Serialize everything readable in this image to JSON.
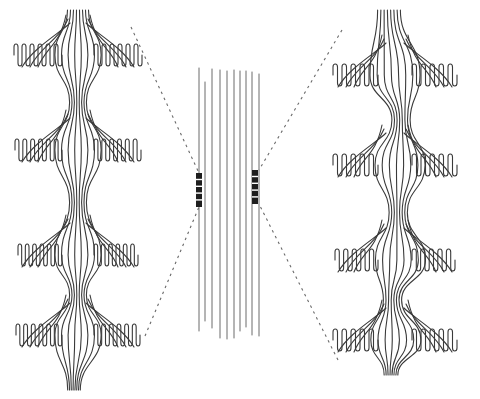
{
  "figure": {
    "colors": {
      "background": "#ffffff",
      "line": "#3a3a3a",
      "band": "#1e1e1e",
      "dash": "#6a6a6a"
    },
    "left_bundle": {
      "center_x": 78,
      "top_y": 10,
      "bottom_y": 390,
      "core_half_width": 12,
      "loop_rows": [
        {
          "y": 55,
          "half_span": 64,
          "loops_per_side": 6
        },
        {
          "y": 150,
          "half_span": 63,
          "loops_per_side": 6
        },
        {
          "y": 255,
          "half_span": 60,
          "loops_per_side": 6
        },
        {
          "y": 335,
          "half_span": 62,
          "loops_per_side": 6
        }
      ]
    },
    "right_bundle": {
      "center_x": 395,
      "top_y": 10,
      "bottom_y": 375,
      "skew": 6,
      "loop_rows": [
        {
          "y": 75,
          "half_span": 62,
          "loops_per_side": 5
        },
        {
          "y": 165,
          "half_span": 62,
          "loops_per_side": 5
        },
        {
          "y": 260,
          "half_span": 60,
          "loops_per_side": 5
        },
        {
          "y": 340,
          "half_span": 62,
          "loops_per_side": 5
        }
      ]
    },
    "center_section": {
      "lines": [
        {
          "x": 199,
          "y1": 68,
          "y2": 331
        },
        {
          "x": 205,
          "y1": 82,
          "y2": 321
        },
        {
          "x": 212,
          "y1": 69,
          "y2": 328
        },
        {
          "x": 220,
          "y1": 70,
          "y2": 338
        },
        {
          "x": 227,
          "y1": 71,
          "y2": 339
        },
        {
          "x": 234,
          "y1": 70,
          "y2": 338
        },
        {
          "x": 240,
          "y1": 71,
          "y2": 331
        },
        {
          "x": 246,
          "y1": 71,
          "y2": 327
        },
        {
          "x": 252,
          "y1": 72,
          "y2": 335
        },
        {
          "x": 259,
          "y1": 74,
          "y2": 336
        }
      ],
      "bands": [
        {
          "x": 199,
          "y": 173,
          "w": 6,
          "h": 34
        },
        {
          "x": 255,
          "y": 170,
          "w": 6,
          "h": 34
        }
      ]
    },
    "projection_lines": [
      {
        "x1": 131,
        "y1": 27,
        "x2": 199,
        "y2": 173
      },
      {
        "x1": 145,
        "y1": 336,
        "x2": 199,
        "y2": 207
      },
      {
        "x1": 342,
        "y1": 30,
        "x2": 259,
        "y2": 170
      },
      {
        "x1": 338,
        "y1": 360,
        "x2": 259,
        "y2": 204
      }
    ]
  }
}
